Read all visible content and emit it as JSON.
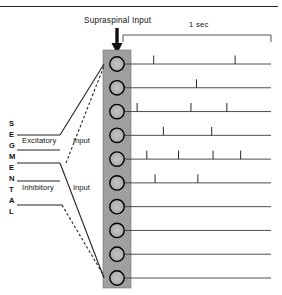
{
  "figure": {
    "title": "Supraspinal Input",
    "scalebar_label": "1 sec",
    "arrow_icon": "down-arrow-icon",
    "segmental_letters": [
      "S",
      "E",
      "G",
      "M",
      "E",
      "N",
      "T",
      "A",
      "L"
    ],
    "pathways": [
      {
        "name": "Excitatory",
        "label": "Excitatory",
        "input_label": "Input"
      },
      {
        "name": "Inhibitory",
        "label": "Inhibitory",
        "input_label": "Input"
      }
    ],
    "colors": {
      "ink": "#111111",
      "line": "#333333",
      "band_fill": "#a8a8a8",
      "band_edge": "#555555",
      "neuron_fill": "#b4b4b4",
      "neuron_edge": "#000000",
      "rule": "#222222"
    },
    "neuron_count": 10
  },
  "chart_data": {
    "type": "raster",
    "title": "Supraspinal Input",
    "xlabel": "",
    "ylabel": "",
    "xlim": [
      0,
      1
    ],
    "x_unit": "sec",
    "scalebar": {
      "label": "1 sec",
      "length": 1
    },
    "grid": false,
    "legend": "none",
    "trial_labels": [
      "1",
      "2",
      "3",
      "4",
      "5",
      "6",
      "7",
      "8",
      "9",
      "10"
    ],
    "spike_counts": [
      2,
      1,
      3,
      2,
      4,
      2,
      0,
      0,
      0,
      0
    ],
    "series": [
      {
        "name": "1",
        "spike_times": [
          0.15,
          0.74
        ]
      },
      {
        "name": "2",
        "spike_times": [
          0.46
        ]
      },
      {
        "name": "3",
        "spike_times": [
          0.03,
          0.42,
          0.68
        ]
      },
      {
        "name": "4",
        "spike_times": [
          0.22,
          0.57
        ]
      },
      {
        "name": "5",
        "spike_times": [
          0.1,
          0.33,
          0.58,
          0.78
        ]
      },
      {
        "name": "6",
        "spike_times": [
          0.16,
          0.47
        ]
      },
      {
        "name": "7",
        "spike_times": []
      },
      {
        "name": "8",
        "spike_times": []
      },
      {
        "name": "9",
        "spike_times": []
      },
      {
        "name": "10",
        "spike_times": []
      }
    ]
  }
}
